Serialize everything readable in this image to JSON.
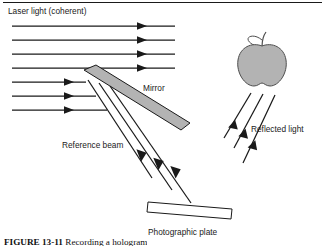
{
  "figure": {
    "background_color": "#ffffff",
    "line_color": "#1a1a1a",
    "fill_gray": "#b3b3b3",
    "labels": {
      "laser_light": "Laser light (coherent)",
      "mirror": "Mirror",
      "reference_beam": "Reference beam",
      "reflected_light": "Reflected light",
      "photographic_plate": "Photographic plate"
    },
    "caption": {
      "number": "FIGURE 13-11",
      "text": "Recording a hologram"
    },
    "objects": {
      "apple_label": "apple",
      "mirror_label": "mirror",
      "plate_label": "photographic plate"
    },
    "beam_counts": {
      "laser_beams_passing": 4,
      "laser_beams_to_mirror": 3,
      "reference_beams": 3,
      "reflected_rays": 3
    }
  }
}
